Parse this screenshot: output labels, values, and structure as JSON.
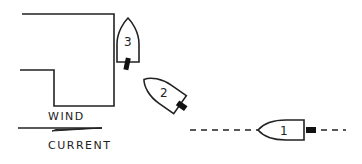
{
  "diagram": {
    "title": "",
    "labels": {
      "wind": "WIND",
      "current": "CURRENT"
    },
    "boats": [
      {
        "id": "boat-1",
        "number": "1",
        "position": "right, on dashed approach line"
      },
      {
        "id": "boat-2",
        "number": "2",
        "position": "angled toward dock corner"
      },
      {
        "id": "boat-3",
        "number": "3",
        "position": "alongside dock end"
      }
    ],
    "colors": {
      "ink": "#222222",
      "background": "#ffffff"
    }
  }
}
